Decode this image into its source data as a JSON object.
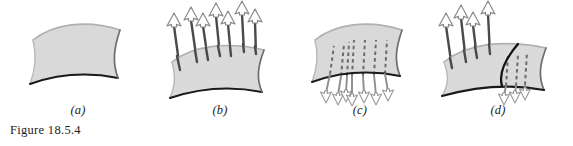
{
  "figure": {
    "caption": "Figure 18.5.4",
    "background_color": "#ffffff",
    "surface_fill": "#d9d9d9",
    "surface_edge_dark": "#1a1a1a",
    "surface_edge_light": "#b3b3b3",
    "vector_color": "#4d4d4d",
    "arrowhead_color": "#808080",
    "panels": [
      {
        "id": "a",
        "label": "(a)",
        "description": "Curved quadrilateral surface patch, no normal vectors",
        "vector_count": 0,
        "vector_direction": "none",
        "orientation": "unoriented"
      },
      {
        "id": "b",
        "label": "(b)",
        "description": "Surface patch with upward normal vectors",
        "vector_count": 8,
        "vector_direction": "up",
        "orientation": "upward"
      },
      {
        "id": "c",
        "label": "(c)",
        "description": "Surface patch with downward normal vectors, dashed where hidden behind surface",
        "vector_count": 7,
        "vector_direction": "down",
        "orientation": "downward"
      },
      {
        "id": "d",
        "label": "(d)",
        "description": "Surface split by a curve: left portion upward normals, right portion downward normals",
        "vector_count": 9,
        "vector_direction": "mixed",
        "orientation": "non-orientable-mixed"
      }
    ]
  }
}
